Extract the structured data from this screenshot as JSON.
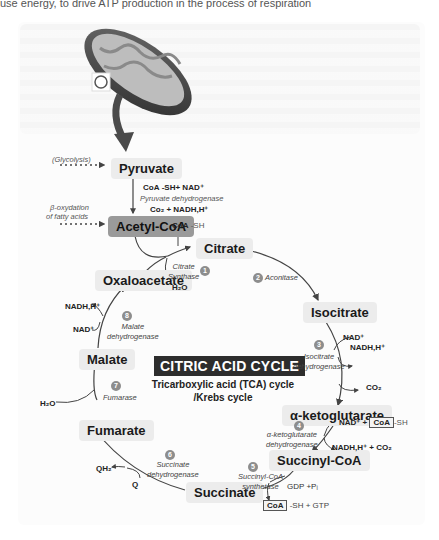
{
  "header": {
    "cropped_text": "use energy, to drive ATP production in the process of respiration"
  },
  "diagram": {
    "title": "CITRIC ACID CYCLE",
    "subtitle_line1": "Tricarboxylic acid (TCA) cycle",
    "subtitle_line2": "/Krebs cycle",
    "inputs": {
      "glycolysis": "(Glycolysis)",
      "beta_ox_line1": "β-oxydation",
      "beta_ox_line2": "of fatty acids"
    },
    "molecules": {
      "pyruvate": "Pyruvate",
      "acetyl_coa": "Acetyl-CoA",
      "citrate": "Citrate",
      "isocitrate": "Isocitrate",
      "alpha_kg": "α-ketoglutarate",
      "succinyl_coa": "Succinyl-CoA",
      "succinate": "Succinate",
      "fumarate": "Fumarate",
      "malate": "Malate",
      "oxaloacetate": "Oxaloacetate"
    },
    "pdh": {
      "in_coa": "CoA",
      "in_rest": "-SH+ NAD⁺",
      "enzyme": "Pyruvate dehydrogenase",
      "out": "Co₂ + NADH,H⁺",
      "coa_sh_coa": "CoA",
      "coa_sh_rest": "-SH"
    },
    "steps": [
      {
        "num": "1",
        "enzyme_line1": "Citrate",
        "enzyme_line2": "Synthase",
        "cofactor": "H₂O"
      },
      {
        "num": "2",
        "enzyme_line1": "Aconitase"
      },
      {
        "num": "3",
        "enzyme_line1": "Isocitrate",
        "enzyme_line2": "dehydrogenase",
        "in": "NAD⁺",
        "out1": "NADH,H⁺",
        "out2": "CO₂"
      },
      {
        "num": "4",
        "enzyme_line1": "α-ketoglutarate",
        "enzyme_line2": "dehydrogenase",
        "in_pre": "NAD⁺ +",
        "in_coa": "CoA",
        "in_post": "-SH",
        "out": "NADH,H⁺ + CO₂"
      },
      {
        "num": "5",
        "enzyme_line1": "Succinyl-CoA",
        "enzyme_line2": "synthetase",
        "in": "GDP +Pᵢ",
        "out_coa": "CoA",
        "out_rest": "-SH + GTP"
      },
      {
        "num": "6",
        "enzyme_line1": "Succinate",
        "enzyme_line2": "dehydrogenase",
        "in": "Q",
        "out": "QH₂"
      },
      {
        "num": "7",
        "enzyme_line1": "Fumarase",
        "cofactor": "H₂O"
      },
      {
        "num": "8",
        "enzyme_line1": "Malate",
        "enzyme_line2": "dehydrogenase",
        "in": "NAD⁺",
        "out": "NADH,H⁺"
      }
    ]
  }
}
